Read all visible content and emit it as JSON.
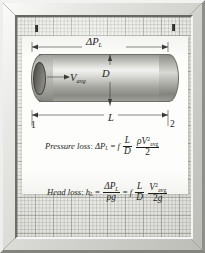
{
  "figure": {
    "kind": "textbook-figure-framed-diagram",
    "title_visible": false
  },
  "diagram": {
    "labels": {
      "pressure_drop": "ΔP",
      "pressure_drop_sub": "L",
      "diameter": "D",
      "length": "L",
      "station_left": "1",
      "station_right": "2",
      "velocity": "V",
      "velocity_sub": "avg"
    },
    "pipe": {
      "shape": "horizontal-cylinder",
      "flow_direction": "left-to-right",
      "flow_arrow_label": "V",
      "flow_arrow_sub": "avg"
    },
    "dimensions": [
      {
        "name": "pressure-drop-dimension",
        "label": "ΔP_L",
        "position": "above-pipe"
      },
      {
        "name": "diameter-dimension",
        "label": "D",
        "position": "vertical-midspan"
      },
      {
        "name": "length-dimension",
        "label": "L",
        "position": "below-pipe"
      }
    ]
  },
  "equations": {
    "pressure_loss": {
      "name": "Pressure loss",
      "lhs_symbol": "ΔP",
      "lhs_sub": "L",
      "equals": "=",
      "friction_factor": "f",
      "ratio_num": "L",
      "ratio_den": "D",
      "term_num_rho": "ρ",
      "term_num_V": "V",
      "term_num_sup": "2",
      "term_num_sub": "avg",
      "term_den": "2",
      "plain_text": "Pressure loss: ΔP_L = f (L/D) (ρ V_avg² / 2)"
    },
    "head_loss": {
      "name": "Head loss",
      "lhs_symbol": "h",
      "lhs_sub": "L",
      "equals": "=",
      "first_num_symbol": "ΔP",
      "first_num_sub": "L",
      "first_den_rho": "ρ",
      "first_den_g": "g",
      "equals2": "=",
      "friction_factor": "f",
      "ratio_num": "L",
      "ratio_den": "D",
      "term_num_V": "V",
      "term_num_sup": "2",
      "term_num_sub": "avg",
      "term_den_2": "2",
      "term_den_g": "g",
      "plain_text": "Head loss: h_L = ΔP_L/(ρg) = f (L/D) (V_avg² / 2g)"
    }
  },
  "colors": {
    "frame_light": "#f2f2f0",
    "frame_dark": "#84847f",
    "grid_paper": "#e9e9e4",
    "card": "#fdfdfc",
    "ink": "#23231f",
    "pipe_highlight": "#f2f2f0",
    "pipe_shadow": "#84847f"
  }
}
